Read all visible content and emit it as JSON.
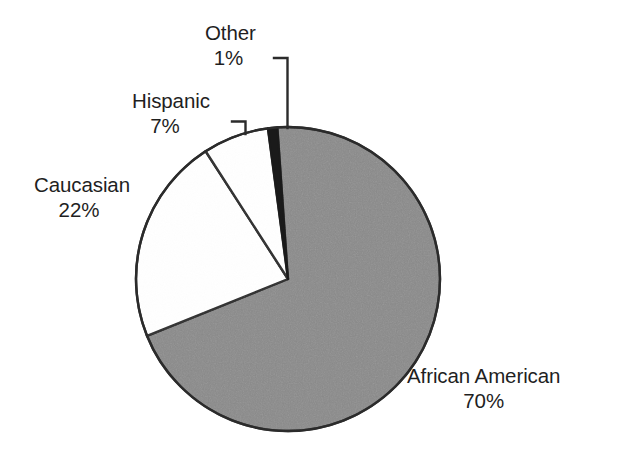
{
  "chart_data": {
    "type": "pie",
    "title": "",
    "subtitle": "",
    "xlabel": "",
    "ylabel": "",
    "legend_position": "none",
    "grid": false,
    "value_suffix": "%",
    "start_angle_deg": -4,
    "direction": "clockwise",
    "categories": [
      "African American",
      "Caucasian",
      "Hispanic",
      "Other"
    ],
    "values": [
      70,
      22,
      7,
      1
    ],
    "slices": [
      {
        "label": "African American",
        "value": 70,
        "value_text": "70%",
        "color": "#8a8a8a",
        "stroke": "#2b2b2b",
        "label_position": "bottom-right",
        "leader_line": false
      },
      {
        "label": "Caucasian",
        "value": 22,
        "value_text": "22%",
        "color": "#ffffff",
        "stroke": "#2b2b2b",
        "label_position": "left",
        "leader_line": false
      },
      {
        "label": "Hispanic",
        "value": 7,
        "value_text": "7%",
        "color": "#ffffff",
        "stroke": "#2b2b2b",
        "label_position": "upper-left",
        "leader_line": true
      },
      {
        "label": "Other",
        "value": 1,
        "value_text": "1%",
        "color": "#1a1a1a",
        "stroke": "#2b2b2b",
        "label_position": "top",
        "leader_line": true
      }
    ]
  },
  "labels": {
    "other": {
      "name": "Other",
      "value": "1%"
    },
    "hispanic": {
      "name": "Hispanic",
      "value": "7%"
    },
    "caucasian": {
      "name": "Caucasian",
      "value": "22%"
    },
    "african_american": {
      "name": "African American",
      "value": "70%"
    }
  },
  "colors": {
    "background": "#ffffff",
    "text": "#1f1f1f",
    "slice_gray": "#8a8a8a",
    "slice_white": "#ffffff",
    "slice_black": "#1a1a1a",
    "outline": "#2b2b2b",
    "leader_line": "#2b2b2b"
  }
}
